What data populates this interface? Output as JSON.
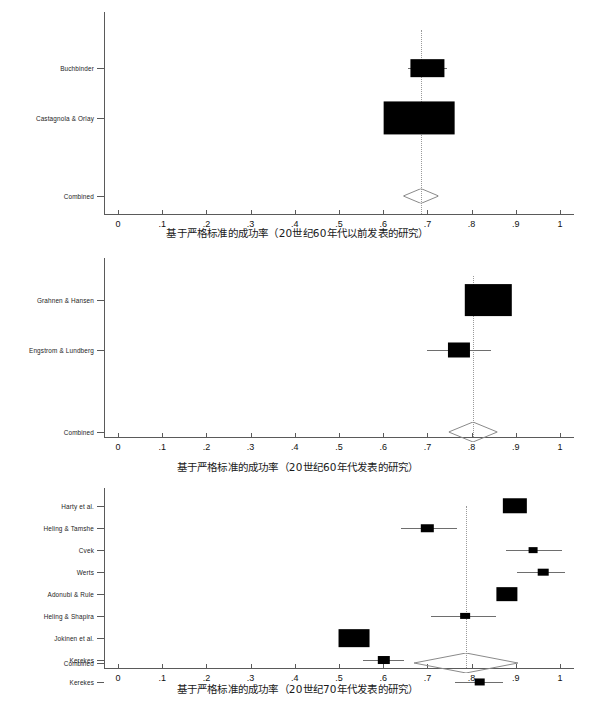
{
  "figure": {
    "background": "#ffffff",
    "marker_color": "#000000",
    "axis_color": "#5a5a5a",
    "ci_color": "#6e6e6e",
    "ref_line_color": "#9a9a9a"
  },
  "axis": {
    "tick_values": [
      0,
      0.1,
      0.2,
      0.3,
      0.4,
      0.5,
      0.6,
      0.7,
      0.8,
      0.9,
      1
    ],
    "tick_labels": [
      "0",
      ".1",
      ".2",
      ".3",
      ".4",
      ".5",
      ".6",
      ".7",
      ".8",
      ".9",
      "1"
    ],
    "xlim": [
      0,
      1
    ]
  },
  "panels": [
    {
      "id": "panel-pre-1960s",
      "caption": "基于严格标准的成功率（20世纪60年代以前发表的研究）",
      "combined_label": "Combined",
      "chart_data": {
        "type": "forest",
        "title": "基于严格标准的成功率（20世纪60年代以前发表的研究）",
        "xlabel": "成功率",
        "ylabel": "",
        "xlim": [
          0,
          1
        ],
        "grid": false,
        "ref_line": 0.685,
        "studies": [
          {
            "label": "Buchbinder",
            "estimate": 0.7,
            "ci_low": 0.655,
            "ci_high": 0.745,
            "box_w": 0.075,
            "box_h": 0.04,
            "weight": 0.3
          },
          {
            "label": "Castagnola & Orlay",
            "estimate": 0.682,
            "ci_low": 0.612,
            "ci_high": 0.752,
            "box_w": 0.16,
            "box_h": 0.075,
            "weight": 0.7
          }
        ],
        "combined": {
          "label": "Combined",
          "estimate": 0.685,
          "ci_low": 0.645,
          "ci_high": 0.725
        }
      }
    },
    {
      "id": "panel-1960s",
      "caption": "基于严格标准的成功率（20世纪60年代发表的研究）",
      "combined_label": "Combined",
      "chart_data": {
        "type": "forest",
        "title": "基于严格标准的成功率（20世纪60年代发表的研究）",
        "xlabel": "成功率",
        "ylabel": "",
        "xlim": [
          0,
          1
        ],
        "grid": false,
        "ref_line": 0.803,
        "studies": [
          {
            "label": "Grahnen & Hansen",
            "estimate": 0.838,
            "ci_low": 0.785,
            "ci_high": 0.89,
            "box_w": 0.105,
            "box_h": 0.072,
            "weight": 0.72
          },
          {
            "label": "Engstrom & Lundberg",
            "estimate": 0.772,
            "ci_low": 0.7,
            "ci_high": 0.845,
            "box_w": 0.05,
            "box_h": 0.034,
            "weight": 0.28
          }
        ],
        "combined": {
          "label": "Combined",
          "estimate": 0.803,
          "ci_low": 0.748,
          "ci_high": 0.858
        }
      }
    },
    {
      "id": "panel-1970s",
      "caption": "基于严格标准的成功率（20世纪70年代发表的研究）",
      "combined_label": "Combined",
      "chart_data": {
        "type": "forest",
        "title": "基于严格标准的成功率（20世纪70年代发表的研究）",
        "xlabel": "成功率",
        "ylabel": "",
        "xlim": [
          0,
          1
        ],
        "grid": false,
        "ref_line": 0.787,
        "studies": [
          {
            "label": "Harty et al.",
            "estimate": 0.898,
            "ci_low": 0.88,
            "ci_high": 0.918,
            "box_w": 0.055,
            "box_h": 0.035,
            "weight": 0.2
          },
          {
            "label": "Heling & Tamshe",
            "estimate": 0.7,
            "ci_low": 0.64,
            "ci_high": 0.768,
            "box_w": 0.028,
            "box_h": 0.017,
            "weight": 0.09
          },
          {
            "label": "Cvek",
            "estimate": 0.94,
            "ci_low": 0.878,
            "ci_high": 1.005,
            "box_w": 0.02,
            "box_h": 0.013,
            "weight": 0.07
          },
          {
            "label": "Werts",
            "estimate": 0.962,
            "ci_low": 0.902,
            "ci_high": 1.012,
            "box_w": 0.024,
            "box_h": 0.015,
            "weight": 0.08
          },
          {
            "label": "Adonubi & Rule",
            "estimate": 0.88,
            "ci_low": 0.858,
            "ci_high": 0.903,
            "box_w": 0.048,
            "box_h": 0.031,
            "weight": 0.18
          },
          {
            "label": "Heling & Shapira",
            "estimate": 0.785,
            "ci_low": 0.708,
            "ci_high": 0.855,
            "box_w": 0.022,
            "box_h": 0.014,
            "weight": 0.07
          },
          {
            "label": "Jokinen et al.",
            "estimate": 0.533,
            "ci_low": 0.512,
            "ci_high": 0.555,
            "box_w": 0.07,
            "box_h": 0.04,
            "weight": 0.22
          },
          {
            "label": "Kerekes",
            "estimate": 0.602,
            "ci_low": 0.555,
            "ci_high": 0.648,
            "box_w": 0.028,
            "box_h": 0.018,
            "weight": 0.09
          },
          {
            "label": "Kerekes",
            "estimate": 0.818,
            "ci_low": 0.762,
            "ci_high": 0.872,
            "box_w": 0.024,
            "box_h": 0.016,
            "weight": 0.08
          }
        ],
        "combined": {
          "label": "Combined",
          "estimate": 0.787,
          "ci_low": 0.67,
          "ci_high": 0.905
        }
      }
    }
  ]
}
